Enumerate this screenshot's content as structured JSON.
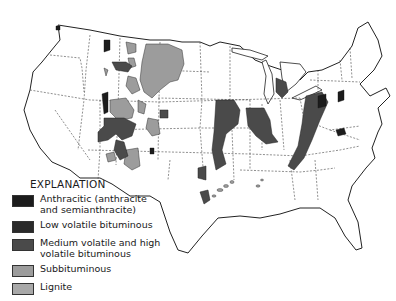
{
  "map": {
    "subject": "Coal fields of the conterminous United States",
    "colors": {
      "anthracitic": "#1c1c1c",
      "low_volatile": "#2a2a2a",
      "medium_high_volatile": "#4a4a4a",
      "subbituminous": "#9c9c9c",
      "lignite": "#a8a8a8",
      "outline": "#222222",
      "state_border": "#444444"
    }
  },
  "legend": {
    "title": "EXPLANATION",
    "items": [
      {
        "label": "Anthracitic (anthracite\nand semianthracite)",
        "color": "#1c1c1c"
      },
      {
        "label": "Low volatile bituminous",
        "color": "#2a2a2a"
      },
      {
        "label": "Medium volatile and high\nvolatile bituminous",
        "color": "#4a4a4a"
      },
      {
        "label": "Subbituminous",
        "color": "#9c9c9c"
      },
      {
        "label": "Lignite",
        "color": "#a8a8a8"
      }
    ]
  }
}
